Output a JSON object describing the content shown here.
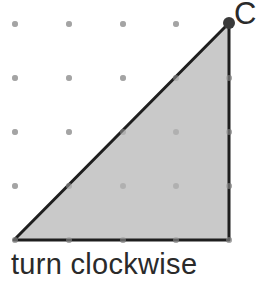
{
  "diagram": {
    "type": "dot-grid-triangle",
    "grid": {
      "xs": [
        15,
        69,
        123,
        176,
        229
      ],
      "ys": [
        24,
        78,
        132,
        186,
        240
      ],
      "dot_color": "#b0b0b0"
    },
    "triangle": {
      "points": "14,240 229,23 229,240",
      "fill": "#c9c9c9",
      "stroke": "#1e1e1e"
    },
    "point": {
      "label": "C",
      "x": 229,
      "y": 23,
      "color": "#3a3a3a"
    }
  },
  "caption": "turn clockwise"
}
